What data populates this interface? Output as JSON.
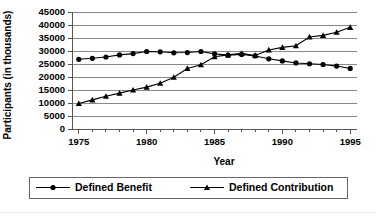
{
  "chart_data": {
    "type": "line",
    "title": "",
    "xlabel": "Year",
    "ylabel": "Participants (in thousands)",
    "x": [
      1975,
      1976,
      1977,
      1978,
      1979,
      1980,
      1981,
      1982,
      1983,
      1984,
      1985,
      1986,
      1987,
      1988,
      1989,
      1990,
      1991,
      1992,
      1993,
      1994,
      1995
    ],
    "xlim": [
      1974.5,
      1995.5
    ],
    "ylim": [
      0,
      45000
    ],
    "ytick_labels": [
      "45000",
      "40000",
      "35000",
      "30000",
      "25000",
      "20000",
      "15000",
      "10000",
      "5000",
      "0"
    ],
    "yticks": [
      45000,
      40000,
      35000,
      30000,
      25000,
      20000,
      15000,
      10000,
      5000,
      0
    ],
    "xtick_labels": [
      "1975",
      "1980",
      "1985",
      "1990",
      "1995"
    ],
    "xticks": [
      1975,
      1980,
      1985,
      1990,
      1995
    ],
    "grid": true,
    "legend_position": "bottom",
    "series": [
      {
        "name": "Defined Benefit",
        "marker": "circle",
        "values": [
          26800,
          27200,
          27700,
          28500,
          29000,
          29800,
          29700,
          29300,
          29400,
          29800,
          28900,
          28400,
          28700,
          28100,
          27000,
          26200,
          25400,
          25100,
          24800,
          24200,
          23300
        ]
      },
      {
        "name": "Defined Contribution",
        "marker": "triangle",
        "values": [
          9800,
          11200,
          12600,
          13800,
          15000,
          16100,
          17600,
          19900,
          23300,
          24700,
          27800,
          28500,
          29100,
          28300,
          30400,
          31400,
          32000,
          35400,
          36000,
          37200,
          39100
        ]
      }
    ]
  },
  "legend": {
    "entries": [
      {
        "label": "Defined Benefit",
        "marker": "circle"
      },
      {
        "label": "Defined Contribution",
        "marker": "triangle"
      }
    ]
  },
  "axes": {
    "x_title": "Year",
    "y_title": "Participants (in thousands)"
  }
}
